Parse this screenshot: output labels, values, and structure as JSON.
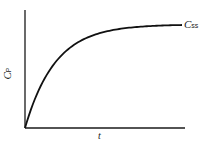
{
  "chart_data": {
    "type": "line",
    "title": "",
    "xlabel": "t",
    "ylabel": "C_P",
    "ylabel_main": "C",
    "ylabel_sub": "P",
    "grid": false,
    "legend": "none",
    "ticks": "none",
    "annotations": [
      {
        "text": "C_ss",
        "main": "C",
        "sub": "ss",
        "position": "right end of curve (steady-state plateau)"
      }
    ],
    "series": [
      {
        "name": "Cp(t)",
        "description": "Exponential rise to plateau: Cp = Css * (1 - e^(-kt))",
        "x": [
          0,
          0.05,
          0.1,
          0.15,
          0.2,
          0.25,
          0.3,
          0.35,
          0.4,
          0.45,
          0.5,
          0.55,
          0.6,
          0.65,
          0.7,
          0.75,
          0.8,
          0.85,
          0.9,
          0.95,
          1.0
        ],
        "values": [
          0,
          0.22,
          0.39,
          0.53,
          0.64,
          0.72,
          0.78,
          0.83,
          0.87,
          0.9,
          0.925,
          0.942,
          0.955,
          0.966,
          0.974,
          0.98,
          0.985,
          0.988,
          0.991,
          0.993,
          0.995
        ]
      }
    ],
    "xlim": [
      0,
      1
    ],
    "ylim": [
      0,
      1.12
    ]
  },
  "labels": {
    "y_main": "C",
    "y_sub": "P",
    "x": "t",
    "plateau_main": "C",
    "plateau_sub": "ss"
  },
  "layout": {
    "origin": [
      25,
      128
    ],
    "x_end": 185,
    "y_top": 10,
    "curve_x_end": 182,
    "plateau_y": 25,
    "color": "#111111"
  }
}
